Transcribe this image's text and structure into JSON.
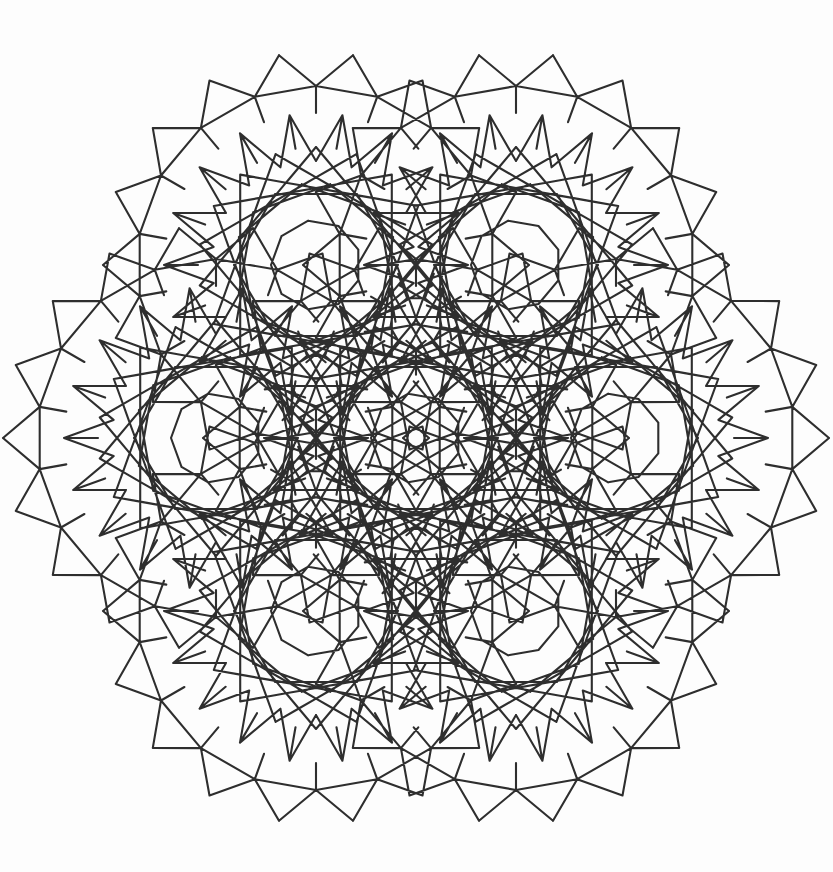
{
  "document": {
    "title": "Islamic Geometric Star Pattern",
    "description": "Line-drawing plate of an interlaced Islamic geometric construction: seven large star rosettes arranged in a hexagonal flower, with small polygonal voids at rosette centres and at the junctions between neighbouring rosettes, bordered by outward triangular points.",
    "kind": "geometric-line-drawing",
    "technique": "ink line drawing / scanned plate"
  },
  "canvas": {
    "width": 833,
    "height": 872,
    "background_color": "#fdfdfd",
    "paper_tint": "#fcfcfc"
  },
  "style": {
    "line_color": "#2e2e2e",
    "line_width": 2.1,
    "line_cap": "round",
    "line_join": "miter",
    "fill": "none"
  },
  "composition": {
    "layout": "hexagonal-flower",
    "rosette_count": 7,
    "arrangement": "1 central rosette surrounded by 6 rosettes on a hexagonal ring",
    "symmetry": "6-fold rotational (D6)",
    "center": {
      "x": 416,
      "y": 438
    },
    "ring_radius": 200,
    "ring_start_angle_deg": 0,
    "overall_bounds": {
      "x": 30,
      "y": 58,
      "width": 775,
      "height": 760
    }
  },
  "rosette": {
    "fold": 18,
    "outer_radius": 196,
    "spike_ring_radius": 196,
    "spike_length": 17,
    "band_radii": [
      {
        "name": "outer-decagon-ring",
        "r": 179
      },
      {
        "name": "star-tip-ring",
        "r": 152
      },
      {
        "name": "petal-ring",
        "r": 118
      },
      {
        "name": "inner-star-ring",
        "r": 82
      },
      {
        "name": "core-polygon-ring",
        "r": 45
      }
    ],
    "core_polygon_sides": 9,
    "core_polygon_radius": 45,
    "star_chord_skip": 7,
    "petal_chord_skip": 5,
    "outer_chord_skip": 3
  },
  "junction": {
    "description": "small polygonal void where three rosettes meet",
    "polygon_sides": 9,
    "radius": 26,
    "count": 12
  },
  "centers": [
    {
      "id": "rosette-center",
      "label": "central rosette",
      "x": 416,
      "y": 438
    },
    {
      "id": "rosette-east",
      "label": "east rosette",
      "x": 616,
      "y": 438
    },
    {
      "id": "rosette-northeast",
      "label": "north-east rosette",
      "x": 516,
      "y": 265
    },
    {
      "id": "rosette-northwest",
      "label": "north-west rosette",
      "x": 316,
      "y": 265
    },
    {
      "id": "rosette-west",
      "label": "west rosette",
      "x": 216,
      "y": 438
    },
    {
      "id": "rosette-southwest",
      "label": "south-west rosette",
      "x": 316,
      "y": 611
    },
    {
      "id": "rosette-southeast",
      "label": "south-east rosette",
      "x": 516,
      "y": 611
    }
  ],
  "voids": [
    {
      "id": "void-center",
      "label": "central nonagon void",
      "x": 416,
      "y": 438,
      "r": 45
    },
    {
      "id": "void-n",
      "label": "north junction void",
      "x": 416,
      "y": 265,
      "r": 28
    },
    {
      "id": "void-s",
      "label": "south junction void",
      "x": 416,
      "y": 611,
      "r": 28
    },
    {
      "id": "void-ne",
      "label": "north-east rosette centre",
      "x": 516,
      "y": 265,
      "r": 45
    },
    {
      "id": "void-nw",
      "label": "north-west rosette centre",
      "x": 316,
      "y": 265,
      "r": 45
    },
    {
      "id": "void-sw",
      "label": "south-west rosette centre",
      "x": 316,
      "y": 611,
      "r": 45
    },
    {
      "id": "void-se",
      "label": "south-east rosette centre",
      "x": 516,
      "y": 611,
      "r": 45
    },
    {
      "id": "void-w",
      "label": "west rosette centre",
      "x": 216,
      "y": 438,
      "r": 45
    },
    {
      "id": "void-e",
      "label": "east rosette centre",
      "x": 616,
      "y": 438,
      "r": 45
    }
  ],
  "caption": {
    "visible": false,
    "text": ""
  }
}
